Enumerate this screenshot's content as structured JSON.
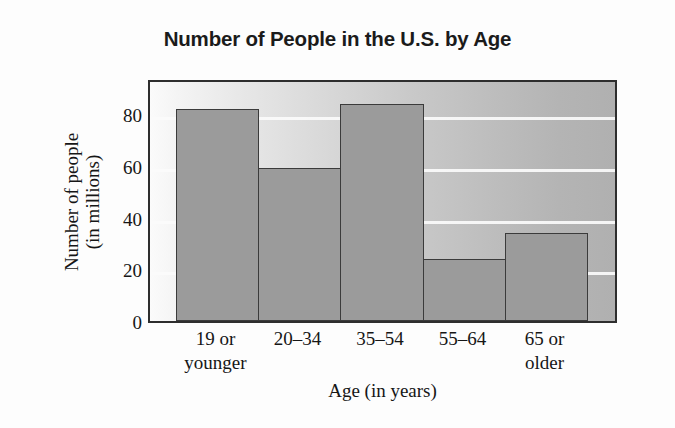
{
  "chart_data": {
    "type": "bar",
    "title": "Number of People in the U.S. by Age",
    "xlabel": "Age (in years)",
    "ylabel": "Number of people\n(in millions)",
    "ylabel_lines": [
      "Number of people",
      "(in millions)"
    ],
    "categories": [
      "19 or younger",
      "20–34",
      "35–54",
      "55–64",
      "65 or older"
    ],
    "category_lines": [
      [
        "19 or",
        "younger"
      ],
      [
        "20–34"
      ],
      [
        "35–54"
      ],
      [
        "55–64"
      ],
      [
        "65 or",
        "older"
      ]
    ],
    "values": [
      82,
      59,
      84,
      24,
      34
    ],
    "yticks": [
      0,
      20,
      40,
      60,
      80
    ],
    "ytick_labels": [
      "0",
      "20",
      "40",
      "60",
      "80"
    ],
    "ylim": [
      0,
      94
    ],
    "xlim_note": "categorical, 5 equal-width adjacent bars",
    "grid": "horizontal white gridlines at 20, 40, 60, 80",
    "legend": "none",
    "colors": {
      "bar_fill": "#9b9b9b",
      "bar_edge": "#3b3b3b",
      "plot_border": "#2e2e2e",
      "gridline": "#fbfbfb",
      "plot_bg_left": "#fbfbfb",
      "plot_bg_right": "#b0b0b0",
      "text": "#161616",
      "page_bg": "#fdfdfd"
    }
  }
}
